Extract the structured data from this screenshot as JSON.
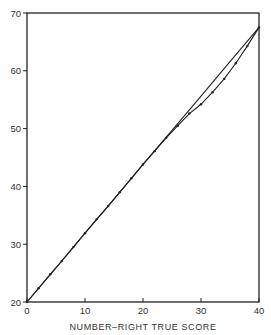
{
  "chart_data": {
    "type": "line",
    "title": "",
    "xlabel": "NUMBER–RIGHT TRUE SCORE",
    "ylabel": "",
    "xlim": [
      0,
      40
    ],
    "ylim": [
      20,
      70
    ],
    "grid": false,
    "legend": null,
    "x_ticks": [
      0,
      10,
      20,
      30,
      40
    ],
    "y_ticks": [
      20,
      30,
      40,
      50,
      60,
      70
    ],
    "series": [
      {
        "name": "smooth line",
        "style": "solid",
        "x": [
          0,
          5,
          10,
          15,
          20,
          25,
          30,
          35,
          40
        ],
        "y": [
          20,
          25.9,
          31.9,
          37.8,
          43.8,
          49.7,
          55.6,
          61.6,
          67.5
        ]
      },
      {
        "name": "dotted curve",
        "style": "solid-with-dots",
        "x": [
          0,
          2,
          4,
          6,
          8,
          10,
          12,
          14,
          16,
          18,
          20,
          22,
          24,
          26,
          28,
          30,
          32,
          34,
          36,
          38,
          40
        ],
        "y": [
          20,
          22.4,
          24.8,
          27.1,
          29.5,
          31.9,
          34.3,
          36.6,
          39.0,
          41.4,
          43.8,
          46.1,
          48.4,
          50.5,
          52.6,
          54.2,
          56.3,
          58.6,
          61.3,
          64.3,
          67.5
        ]
      }
    ]
  }
}
